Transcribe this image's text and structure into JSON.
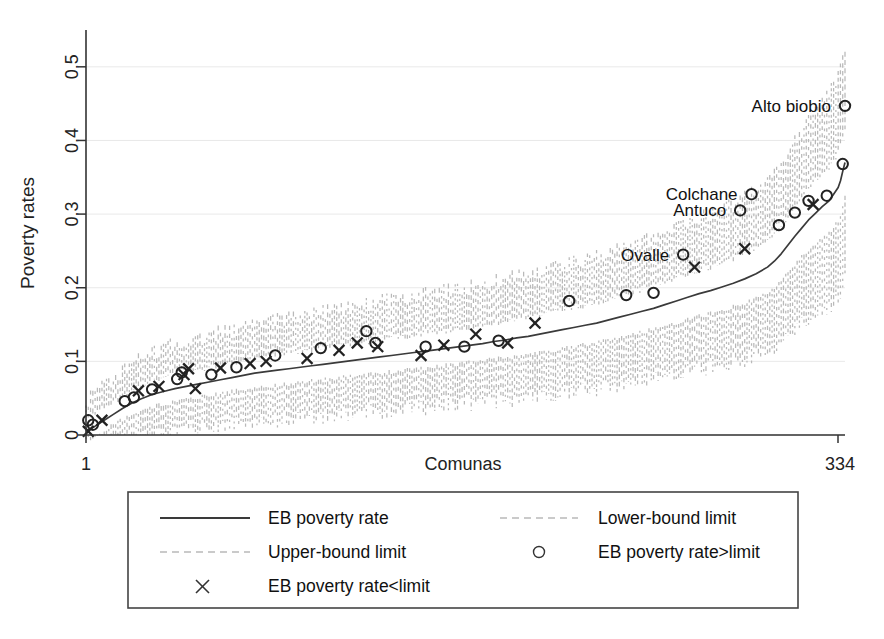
{
  "chart_data": {
    "type": "line",
    "title": "",
    "xlabel": "Comunas",
    "ylabel": "Poverty rates",
    "xlim": [
      1,
      334
    ],
    "ylim": [
      0,
      0.55
    ],
    "grid": true,
    "xtick_labels": [
      "1",
      "334"
    ],
    "xtick_values": [
      1,
      334
    ],
    "ytick_labels": [
      "0",
      "0.1",
      "0.2",
      "0.3",
      "0.4",
      "0.5"
    ],
    "ytick_values": [
      0,
      0.1,
      0.2,
      0.3,
      0.4,
      0.5
    ],
    "legend_position": "below-plot",
    "series": [
      {
        "name": "EB poverty rate",
        "style": "solid",
        "color": "#3a3a3a",
        "x": [
          1,
          5,
          9,
          13,
          17,
          21,
          25,
          30,
          35,
          40,
          45,
          50,
          55,
          60,
          65,
          70,
          75,
          80,
          85,
          90,
          95,
          100,
          105,
          110,
          115,
          120,
          125,
          130,
          135,
          140,
          145,
          150,
          155,
          160,
          165,
          170,
          175,
          180,
          185,
          190,
          195,
          200,
          205,
          210,
          215,
          220,
          225,
          230,
          235,
          240,
          245,
          250,
          255,
          260,
          265,
          270,
          275,
          280,
          285,
          290,
          295,
          300,
          303,
          306,
          309,
          312,
          315,
          318,
          321,
          324,
          327,
          329,
          331,
          332,
          333,
          334
        ],
        "values": [
          0.005,
          0.012,
          0.02,
          0.028,
          0.036,
          0.043,
          0.049,
          0.055,
          0.059,
          0.063,
          0.066,
          0.069,
          0.072,
          0.075,
          0.078,
          0.081,
          0.084,
          0.086,
          0.088,
          0.09,
          0.092,
          0.094,
          0.096,
          0.098,
          0.1,
          0.102,
          0.104,
          0.106,
          0.108,
          0.11,
          0.112,
          0.114,
          0.116,
          0.118,
          0.12,
          0.122,
          0.124,
          0.127,
          0.129,
          0.132,
          0.134,
          0.137,
          0.14,
          0.143,
          0.146,
          0.149,
          0.152,
          0.156,
          0.16,
          0.164,
          0.168,
          0.172,
          0.177,
          0.182,
          0.187,
          0.192,
          0.196,
          0.201,
          0.206,
          0.212,
          0.219,
          0.228,
          0.236,
          0.246,
          0.258,
          0.27,
          0.281,
          0.292,
          0.301,
          0.31,
          0.318,
          0.327,
          0.336,
          0.345,
          0.358,
          0.37
        ]
      },
      {
        "name": "Upper-bound limit",
        "style": "dashed",
        "color": "#b9b9b9"
      },
      {
        "name": "Lower-bound limit",
        "style": "dashed",
        "color": "#b9b9b9"
      }
    ],
    "markers": {
      "circle": {
        "name": "EB poverty rate>limit",
        "points": [
          {
            "x": 2,
            "y": 0.02
          },
          {
            "x": 4,
            "y": 0.014
          },
          {
            "x": 18,
            "y": 0.046
          },
          {
            "x": 22,
            "y": 0.051
          },
          {
            "x": 30,
            "y": 0.062
          },
          {
            "x": 41,
            "y": 0.076
          },
          {
            "x": 43,
            "y": 0.085
          },
          {
            "x": 56,
            "y": 0.082
          },
          {
            "x": 67,
            "y": 0.092
          },
          {
            "x": 84,
            "y": 0.108
          },
          {
            "x": 104,
            "y": 0.118
          },
          {
            "x": 124,
            "y": 0.141
          },
          {
            "x": 128,
            "y": 0.125
          },
          {
            "x": 150,
            "y": 0.12
          },
          {
            "x": 167,
            "y": 0.12
          },
          {
            "x": 182,
            "y": 0.128
          },
          {
            "x": 213,
            "y": 0.182
          },
          {
            "x": 238,
            "y": 0.19
          },
          {
            "x": 250,
            "y": 0.193
          },
          {
            "x": 263,
            "y": 0.245,
            "label": "Ovalle"
          },
          {
            "x": 288,
            "y": 0.305,
            "label": "Antuco"
          },
          {
            "x": 293,
            "y": 0.327,
            "label": "Colchane"
          },
          {
            "x": 305,
            "y": 0.285
          },
          {
            "x": 312,
            "y": 0.302
          },
          {
            "x": 318,
            "y": 0.318
          },
          {
            "x": 326,
            "y": 0.325
          },
          {
            "x": 333,
            "y": 0.368
          },
          {
            "x": 334,
            "y": 0.447,
            "label": "Alto biobio"
          }
        ]
      },
      "cross": {
        "name": "EB poverty rate<limit",
        "points": [
          {
            "x": 2,
            "y": 0.005
          },
          {
            "x": 8,
            "y": 0.02
          },
          {
            "x": 24,
            "y": 0.06
          },
          {
            "x": 33,
            "y": 0.066
          },
          {
            "x": 44,
            "y": 0.082
          },
          {
            "x": 46,
            "y": 0.09
          },
          {
            "x": 49,
            "y": 0.063
          },
          {
            "x": 60,
            "y": 0.091
          },
          {
            "x": 73,
            "y": 0.097
          },
          {
            "x": 80,
            "y": 0.1
          },
          {
            "x": 98,
            "y": 0.104
          },
          {
            "x": 112,
            "y": 0.115
          },
          {
            "x": 120,
            "y": 0.125
          },
          {
            "x": 129,
            "y": 0.12
          },
          {
            "x": 148,
            "y": 0.108
          },
          {
            "x": 158,
            "y": 0.122
          },
          {
            "x": 172,
            "y": 0.137
          },
          {
            "x": 186,
            "y": 0.125
          },
          {
            "x": 198,
            "y": 0.152
          },
          {
            "x": 268,
            "y": 0.228
          },
          {
            "x": 290,
            "y": 0.253
          },
          {
            "x": 320,
            "y": 0.313
          }
        ]
      }
    },
    "annotations": [
      {
        "text": "Alto biobio",
        "x": 334,
        "y": 0.447
      },
      {
        "text": "Colchane",
        "x": 293,
        "y": 0.327
      },
      {
        "text": "Antuco",
        "x": 288,
        "y": 0.305
      },
      {
        "text": "Ovalle",
        "x": 263,
        "y": 0.245
      }
    ]
  },
  "legend": {
    "items": [
      {
        "label": "EB poverty rate",
        "marker": "solid-line"
      },
      {
        "label": "Lower-bound limit",
        "marker": "dashed-line"
      },
      {
        "label": "Upper-bound limit",
        "marker": "dashed-line"
      },
      {
        "label": "EB poverty rate>limit",
        "marker": "circle"
      },
      {
        "label": "EB poverty rate<limit",
        "marker": "cross"
      }
    ]
  }
}
